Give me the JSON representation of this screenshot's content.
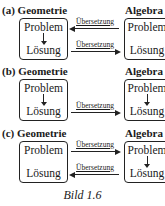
{
  "panels": [
    {
      "label": "(a) Geometrie",
      "left_title": "Geometrie",
      "right_title": "Algebra",
      "left_box": {
        "top": "Problem",
        "bottom": "Lösung",
        "has_down_arrow": true
      },
      "right_box": {
        "top": "Problem",
        "bottom": "Lösung",
        "has_down_arrow": false
      },
      "arrows": [
        {
          "label": "Übersetzung",
          "row": "top",
          "direction": "left"
        },
        {
          "label": "Übersetzung",
          "row": "bottom",
          "direction": "right"
        }
      ]
    },
    {
      "label": "(b) Geometrie",
      "left_title": "Geometrie",
      "right_title": "Algebra",
      "left_box": {
        "top": "Problem",
        "bottom": "Lösung",
        "has_down_arrow": true
      },
      "right_box": {
        "top": "Problem",
        "bottom": "Lösung",
        "has_down_arrow": true
      },
      "arrows": [
        {
          "label": "Übersetzung",
          "row": "bottom",
          "direction": "right"
        }
      ]
    },
    {
      "label": "(c) Geometrie",
      "left_title": "Geometrie",
      "right_title": "Algebra",
      "left_box": {
        "top": "Problem",
        "bottom": "Lösung",
        "has_down_arrow": false
      },
      "right_box": {
        "top": "Problem",
        "bottom": "Lösung",
        "has_down_arrow": true
      },
      "arrows": [
        {
          "label": "Übersetzung",
          "row": "top",
          "direction": "right"
        },
        {
          "label": "Übersetzung",
          "row": "bottom",
          "direction": "left"
        }
      ]
    }
  ],
  "caption": "Bild 1.6"
}
